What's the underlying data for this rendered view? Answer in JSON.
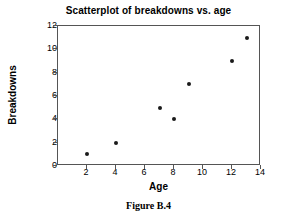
{
  "chart_data": {
    "type": "scatter",
    "title": "Scatterplot of breakdowns vs. age",
    "xlabel": "Age",
    "ylabel": "Breakdowns",
    "xlim": [
      0,
      14
    ],
    "ylim": [
      0,
      12
    ],
    "xticks": [
      2,
      4,
      6,
      8,
      10,
      12,
      14
    ],
    "yticks": [
      0,
      2,
      4,
      6,
      8,
      10,
      12
    ],
    "grid": false,
    "legend": null,
    "marker_color": "#1a1a1a",
    "axis_color": "#555555",
    "points": [
      {
        "x": 2,
        "y": 1
      },
      {
        "x": 4,
        "y": 2
      },
      {
        "x": 7,
        "y": 5
      },
      {
        "x": 8,
        "y": 4
      },
      {
        "x": 9,
        "y": 7
      },
      {
        "x": 12,
        "y": 9
      },
      {
        "x": 13,
        "y": 11
      }
    ],
    "x": [
      2,
      4,
      7,
      8,
      9,
      12,
      13
    ],
    "y": [
      1,
      2,
      5,
      4,
      7,
      9,
      11
    ]
  },
  "caption": "Figure B.4"
}
